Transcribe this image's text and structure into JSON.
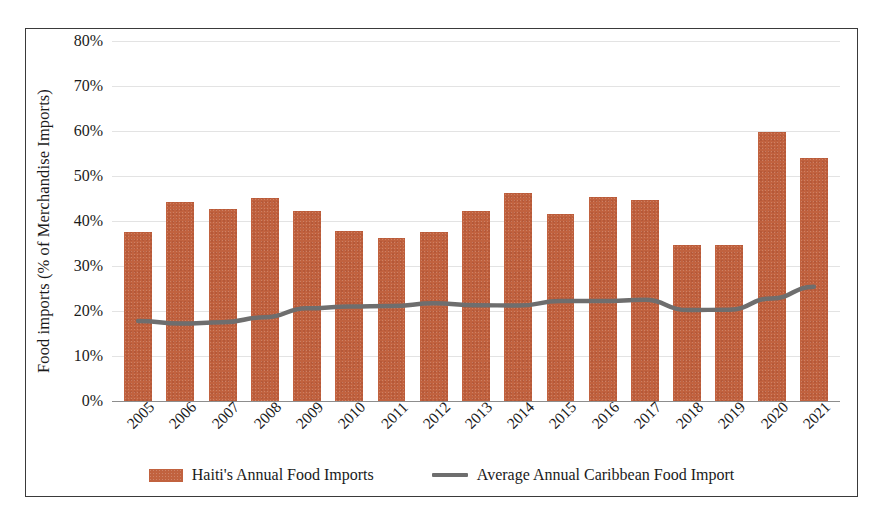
{
  "chart_data": {
    "type": "bar",
    "title": "",
    "xlabel": "",
    "ylabel": "Food imports (% of Merchandise Imports)",
    "ylim": [
      0,
      80
    ],
    "ytick_labels": [
      "0%",
      "10%",
      "20%",
      "30%",
      "40%",
      "50%",
      "60%",
      "70%",
      "80%"
    ],
    "ytick_values": [
      0,
      10,
      20,
      30,
      40,
      50,
      60,
      70,
      80
    ],
    "grid": true,
    "legend_position": "bottom",
    "categories": [
      "2005",
      "2006",
      "2007",
      "2008",
      "2009",
      "2010",
      "2011",
      "2012",
      "2013",
      "2014",
      "2015",
      "2016",
      "2017",
      "2018",
      "2019",
      "2020",
      "2021"
    ],
    "series": [
      {
        "name": "Haiti's Annual Food Imports",
        "type": "bar",
        "color": "#c1623f",
        "values": [
          37.6,
          44.2,
          42.6,
          45.1,
          42.3,
          37.8,
          36.2,
          37.5,
          42.3,
          46.3,
          41.5,
          45.3,
          44.6,
          34.6,
          34.6,
          59.8,
          54.0
        ]
      },
      {
        "name": "Average Annual Caribbean Food Import",
        "type": "line",
        "color": "#6e6e6e",
        "values": [
          17.8,
          17.2,
          17.5,
          18.6,
          20.6,
          21.0,
          21.1,
          21.7,
          21.3,
          21.2,
          22.2,
          22.2,
          22.5,
          20.2,
          20.3,
          22.8,
          25.4
        ]
      }
    ]
  },
  "legend": {
    "items": [
      {
        "label": "Haiti's Annual Food Imports",
        "marker": "bar-swatch"
      },
      {
        "label": "Average Annual Caribbean Food Import",
        "marker": "line-swatch"
      }
    ]
  }
}
